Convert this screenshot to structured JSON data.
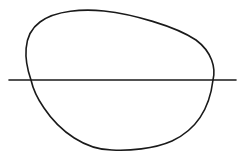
{
  "figure": {
    "background": "#ffffff",
    "stroke_color": "#1a1a1a",
    "loop": {
      "stroke_width": 1.6,
      "path": "M 31 80 C 24 60, 22 35, 40 22 C 56 10, 84 9, 104 11 C 132 14, 175 26, 196 40 C 212 52, 216 68, 213 80 C 210 105, 200 128, 172 141 C 154 149, 128 151, 112 150 C 86 150, 60 132, 44 108 C 37 98, 33 89, 31 80 Z"
    },
    "line": {
      "x1": 9,
      "y1": 80,
      "x2": 236,
      "y2": 80,
      "stroke_width": 1.6
    }
  }
}
